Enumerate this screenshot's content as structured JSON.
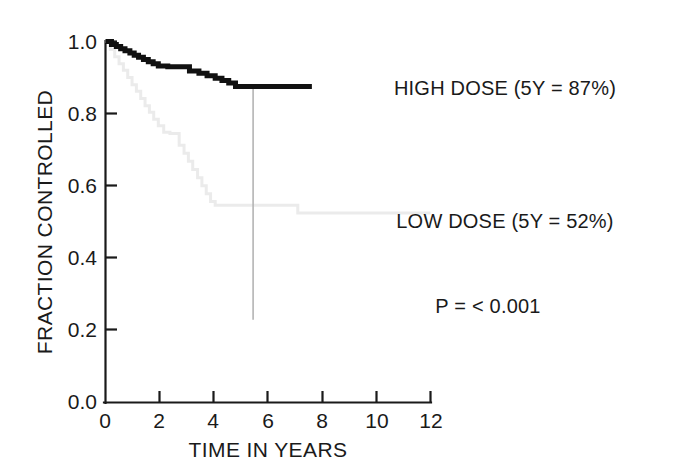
{
  "chart_data": {
    "type": "line",
    "title": "",
    "subtitle": "",
    "xlabel": "TIME IN YEARS",
    "ylabel": "FRACTION CONTROLLED",
    "xlim": [
      0,
      12
    ],
    "ylim": [
      0.0,
      1.0
    ],
    "xticks": [
      "0",
      "2",
      "4",
      "6",
      "8",
      "10",
      "12"
    ],
    "xtick_values": [
      0,
      2,
      4,
      6,
      8,
      10,
      12
    ],
    "yticks": [
      "0.0",
      "0.2",
      "0.4",
      "0.6",
      "0.8",
      "1.0"
    ],
    "ytick_values": [
      0.0,
      0.2,
      0.4,
      0.6,
      0.8,
      1.0
    ],
    "grid": false,
    "legend_position": "right-inline-annotations",
    "style": "kaplan-meier step curves",
    "series": [
      {
        "name": "HIGH DOSE",
        "label": "HIGH DOSE (5Y = 87%)",
        "color": "#111111",
        "linewidth": "thick",
        "five_year_value": 0.87,
        "five_year_percent": "87%",
        "points": [
          [
            0.0,
            1.0
          ],
          [
            0.22,
            1.0
          ],
          [
            0.22,
            0.992
          ],
          [
            0.4,
            0.992
          ],
          [
            0.4,
            0.986
          ],
          [
            0.56,
            0.986
          ],
          [
            0.56,
            0.98
          ],
          [
            0.72,
            0.98
          ],
          [
            0.72,
            0.974
          ],
          [
            0.9,
            0.974
          ],
          [
            0.9,
            0.968
          ],
          [
            1.06,
            0.968
          ],
          [
            1.06,
            0.962
          ],
          [
            1.22,
            0.962
          ],
          [
            1.22,
            0.956
          ],
          [
            1.4,
            0.956
          ],
          [
            1.4,
            0.95
          ],
          [
            1.58,
            0.95
          ],
          [
            1.58,
            0.944
          ],
          [
            1.76,
            0.944
          ],
          [
            1.76,
            0.938
          ],
          [
            1.95,
            0.938
          ],
          [
            1.95,
            0.932
          ],
          [
            2.3,
            0.932
          ],
          [
            2.3,
            0.93
          ],
          [
            3.1,
            0.93
          ],
          [
            3.1,
            0.918
          ],
          [
            3.45,
            0.918
          ],
          [
            3.45,
            0.912
          ],
          [
            3.75,
            0.912
          ],
          [
            3.75,
            0.905
          ],
          [
            4.05,
            0.905
          ],
          [
            4.05,
            0.898
          ],
          [
            4.3,
            0.898
          ],
          [
            4.3,
            0.892
          ],
          [
            4.55,
            0.892
          ],
          [
            4.55,
            0.885
          ],
          [
            4.8,
            0.885
          ],
          [
            4.8,
            0.875
          ],
          [
            7.62,
            0.875
          ]
        ]
      },
      {
        "name": "LOW DOSE",
        "label": "LOW DOSE (5Y = 52%)",
        "color": "#ebebeb",
        "linewidth": "thin",
        "five_year_value": 0.52,
        "five_year_percent": "52%",
        "points": [
          [
            0.0,
            1.0
          ],
          [
            0.18,
            1.0
          ],
          [
            0.18,
            0.978
          ],
          [
            0.34,
            0.978
          ],
          [
            0.34,
            0.958
          ],
          [
            0.5,
            0.958
          ],
          [
            0.5,
            0.938
          ],
          [
            0.66,
            0.938
          ],
          [
            0.66,
            0.92
          ],
          [
            0.82,
            0.92
          ],
          [
            0.82,
            0.9
          ],
          [
            0.98,
            0.9
          ],
          [
            0.98,
            0.88
          ],
          [
            1.14,
            0.88
          ],
          [
            1.14,
            0.862
          ],
          [
            1.3,
            0.862
          ],
          [
            1.3,
            0.842
          ],
          [
            1.46,
            0.842
          ],
          [
            1.46,
            0.822
          ],
          [
            1.62,
            0.822
          ],
          [
            1.62,
            0.804
          ],
          [
            1.78,
            0.804
          ],
          [
            1.78,
            0.784
          ],
          [
            1.95,
            0.784
          ],
          [
            1.95,
            0.766
          ],
          [
            2.15,
            0.766
          ],
          [
            2.15,
            0.748
          ],
          [
            2.38,
            0.748
          ],
          [
            2.38,
            0.745
          ],
          [
            2.72,
            0.745
          ],
          [
            2.72,
            0.712
          ],
          [
            2.9,
            0.712
          ],
          [
            2.9,
            0.69
          ],
          [
            3.06,
            0.69
          ],
          [
            3.06,
            0.668
          ],
          [
            3.22,
            0.668
          ],
          [
            3.22,
            0.645
          ],
          [
            3.4,
            0.645
          ],
          [
            3.4,
            0.622
          ],
          [
            3.56,
            0.622
          ],
          [
            3.56,
            0.6
          ],
          [
            3.72,
            0.6
          ],
          [
            3.72,
            0.578
          ],
          [
            3.88,
            0.578
          ],
          [
            3.88,
            0.556
          ],
          [
            4.05,
            0.556
          ],
          [
            4.05,
            0.546
          ],
          [
            7.1,
            0.546
          ],
          [
            7.1,
            0.524
          ],
          [
            12.0,
            0.524
          ]
        ]
      }
    ],
    "reference_line": {
      "name": "five-year-marker",
      "x": 5.45,
      "y_top": 0.875,
      "y_bottom": 0.228,
      "color": "#b4b4b4"
    },
    "annotations": [
      {
        "name": "p-value",
        "text": "P = < 0.001"
      }
    ]
  },
  "annotations": {
    "high_dose_label": "HIGH DOSE (5Y = 87%)",
    "low_dose_label": "LOW DOSE (5Y = 52%)",
    "p_value_label": "P = < 0.001"
  },
  "axes": {
    "x_title": "TIME IN YEARS",
    "y_title": "FRACTION CONTROLLED",
    "x_ticks": [
      "0",
      "2",
      "4",
      "6",
      "8",
      "10",
      "12"
    ],
    "y_ticks": [
      "1.0",
      "0.8",
      "0.6",
      "0.4",
      "0.2",
      "0.0"
    ]
  },
  "colors": {
    "axis": "#1a1a1a",
    "high_dose": "#111111",
    "low_dose": "#ebebeb",
    "reference_line": "#b4b4b4",
    "background": "#ffffff"
  }
}
